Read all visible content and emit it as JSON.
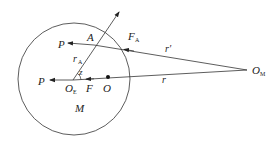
{
  "diagram": {
    "labels": {
      "A": "A",
      "F_A": "F",
      "F_A_sub": "A",
      "P_top": "P",
      "r_A": "r",
      "r_A_sub": "A",
      "z": "z",
      "P_left": "P",
      "O_E": "O",
      "O_E_sub": "E",
      "F": "F",
      "O": "O",
      "M": "M",
      "r_prime": "r′",
      "r": "r",
      "O_M": "O",
      "O_M_sub": "M"
    },
    "colors": {
      "stroke": "#333333",
      "text": "#222222",
      "background": "#ffffff"
    }
  }
}
